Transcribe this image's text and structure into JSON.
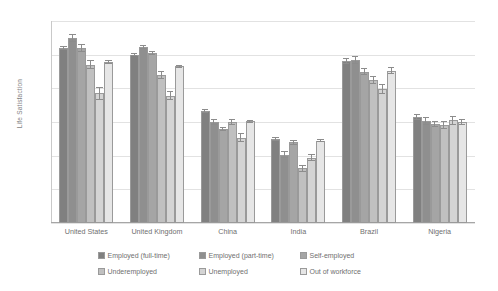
{
  "chart_data": {
    "type": "bar",
    "title": "",
    "xlabel": "",
    "ylabel": "Life Satisfaction",
    "ylim": [
      2,
      8
    ],
    "yticks": [
      2,
      3,
      4,
      5,
      6,
      7,
      8
    ],
    "grid": true,
    "legend_position": "bottom",
    "categories": [
      "United States",
      "United Kingdom",
      "China",
      "India",
      "Brazil",
      "Nigeria"
    ],
    "series": [
      {
        "name": "Employed (full-time)",
        "color": "#808080",
        "values": [
          7.2,
          7.0,
          5.33,
          4.5,
          6.8,
          5.15
        ],
        "errors": [
          0.06,
          0.05,
          0.06,
          0.07,
          0.09,
          0.1
        ]
      },
      {
        "name": "Employed (part-time)",
        "color": "#8f8f8f",
        "values": [
          7.5,
          7.22,
          5.0,
          4.03,
          6.85,
          5.03
        ],
        "errors": [
          0.11,
          0.06,
          0.1,
          0.1,
          0.12,
          0.11
        ]
      },
      {
        "name": "Self-employed",
        "color": "#a5a5a5",
        "values": [
          7.2,
          7.05,
          4.8,
          4.4,
          6.5,
          4.95
        ],
        "errors": [
          0.12,
          0.06,
          0.06,
          0.07,
          0.1,
          0.09
        ]
      },
      {
        "name": "Underemployed",
        "color": "#c0c0c0",
        "values": [
          6.7,
          6.4,
          5.0,
          3.62,
          6.25,
          4.9
        ],
        "errors": [
          0.14,
          0.11,
          0.1,
          0.09,
          0.13,
          0.12
        ]
      },
      {
        "name": "Unemployed",
        "color": "#d4d4d4",
        "values": [
          5.85,
          5.78,
          4.53,
          3.94,
          5.97,
          5.05
        ],
        "errors": [
          0.2,
          0.13,
          0.13,
          0.11,
          0.15,
          0.13
        ]
      },
      {
        "name": "Out of workforce",
        "color": "#e6e6e6",
        "values": [
          6.78,
          6.65,
          5.02,
          4.45,
          6.53,
          5.0
        ],
        "errors": [
          0.07,
          0.05,
          0.05,
          0.05,
          0.1,
          0.08
        ]
      }
    ]
  }
}
